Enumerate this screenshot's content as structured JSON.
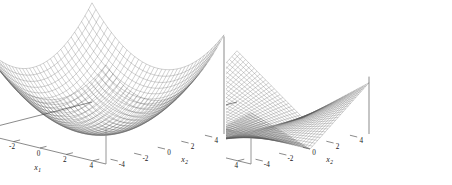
{
  "figure": {
    "background_color": "#ffffff",
    "panel_count": 2
  },
  "chart_data": [
    {
      "type": "surface",
      "panel": "left",
      "title": "",
      "zlabel": "f(x)",
      "xlabel": "x_1",
      "xlabel_text": "x",
      "xlabel_sub": "1",
      "ylabel": "x_2",
      "ylabel_text": "x",
      "ylabel_sub": "2",
      "function": "f(x) = x1^2 + x2^2",
      "surface_style": "wireframe-mesh",
      "mesh_color": "#555555",
      "xlim": [
        -5,
        5
      ],
      "ylim": [
        -5,
        5
      ],
      "zlim": [
        0,
        60
      ],
      "xticks": [
        -4,
        -2,
        0,
        2,
        4
      ],
      "xtick_labels": [
        "-4",
        "-2",
        "0",
        "2",
        "4"
      ],
      "yticks": [
        -4,
        -2,
        0,
        2,
        4
      ],
      "ytick_labels": [
        "-4",
        "-2",
        "0",
        "2",
        "4"
      ],
      "zticks": [
        0,
        10,
        20,
        30,
        40,
        50,
        60
      ],
      "ztick_labels": [
        "0",
        "10",
        "20",
        "30",
        "40",
        "50",
        "60"
      ],
      "grid": false,
      "legend": "none",
      "minimum": {
        "x1": 0,
        "x2": 0,
        "f": 0
      },
      "corner_value": 50,
      "samples": 41
    },
    {
      "type": "surface",
      "panel": "right",
      "title": "",
      "zlabel": "f(x)",
      "xlabel": "x_1",
      "xlabel_text": "x",
      "xlabel_sub": "1",
      "ylabel": "x_2",
      "ylabel_text": "x",
      "ylabel_sub": "2",
      "function": "f(x) = |x1| * |x2| ridge / absolute-value saddle",
      "surface_style": "wireframe-mesh",
      "mesh_color": "#555555",
      "xlim": [
        -5,
        5
      ],
      "ylim": [
        -5,
        5
      ],
      "zlim": [
        0,
        40
      ],
      "xticks": [
        -4,
        -2,
        0,
        2,
        4
      ],
      "xtick_labels": [
        "-4",
        "-2",
        "0",
        "2",
        "4"
      ],
      "yticks": [
        -4,
        -2,
        0,
        2,
        4
      ],
      "ytick_labels": [
        "-4",
        "-2",
        "0",
        "2",
        "4"
      ],
      "zticks": [
        0,
        5,
        10,
        15,
        20,
        25,
        30,
        35,
        40
      ],
      "ztick_labels": [
        "0",
        "5",
        "10",
        "15",
        "20",
        "25",
        "30",
        "35",
        "40"
      ],
      "grid": false,
      "legend": "none",
      "minimum": {
        "x1": 0,
        "x2": 0,
        "f": 0
      },
      "corner_value": 36,
      "samples": 49
    }
  ]
}
